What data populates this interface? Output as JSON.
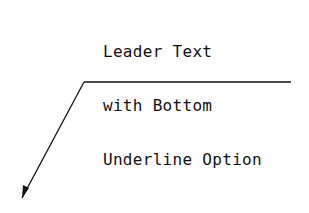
{
  "annotation": {
    "lines": [
      "Leader Text",
      "with Bottom",
      "Underline Option"
    ]
  },
  "geometry": {
    "underline": {
      "x1": 84,
      "y1": 82,
      "x2": 291,
      "y2": 82
    },
    "leader": {
      "x1": 84,
      "y1": 82,
      "x2": 22,
      "y2": 198
    },
    "arrowhead": "22,198 23,185 29,188"
  },
  "colors": {
    "stroke": "#111111",
    "background": "#ffffff"
  }
}
